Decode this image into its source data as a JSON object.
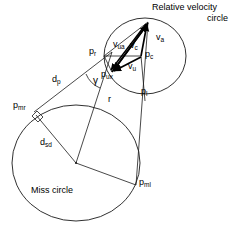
{
  "figure": {
    "name": "relative-velocity-and-miss-circle-geometry-diagram",
    "stroke_color": "#1a1a1a",
    "bold_stroke_color": "#000000",
    "background_color": "#ffffff"
  },
  "captions": {
    "relative_velocity_circle_line1": "Relative velocity",
    "relative_velocity_circle_line2": "circle",
    "miss_circle": "Miss circle"
  },
  "labels": {
    "v_a": {
      "base": "v",
      "sub": "a"
    },
    "v_c": {
      "base": "v",
      "sub": "c"
    },
    "v_u": {
      "base": "v",
      "sub": "u"
    },
    "v_ua": {
      "base": "v",
      "sub": "ua"
    },
    "p_r": {
      "base": "p",
      "sub": "r"
    },
    "p_c": {
      "base": "p",
      "sub": "c"
    },
    "p_l": {
      "base": "p",
      "sub": "l"
    },
    "p_ux": {
      "base": "p",
      "sub": "ux"
    },
    "p_mr": {
      "base": "p",
      "sub": "mr"
    },
    "p_ml": {
      "base": "p",
      "sub": "ml"
    },
    "d_p": {
      "base": "d",
      "sub": "p"
    },
    "d_sd": {
      "base": "d",
      "sub": "sd"
    },
    "r": {
      "base": "r",
      "sub": ""
    },
    "gamma": {
      "base": "γ",
      "sub": ""
    }
  },
  "geometry": {
    "relative_velocity_circle": {
      "cx": 145,
      "cy": 56,
      "rx": 41,
      "ry": 38
    },
    "miss_circle": {
      "cx": 76,
      "cy": 163,
      "rx": 64,
      "ry": 58
    },
    "points": {
      "apex": {
        "x": 148,
        "y": 22
      },
      "p_c": {
        "x": 141,
        "y": 56
      },
      "p_r": {
        "x": 104,
        "y": 56
      },
      "p_ux": {
        "x": 110,
        "y": 71
      },
      "p_l": {
        "x": 143,
        "y": 88
      },
      "p_mr": {
        "x": 34,
        "y": 112
      },
      "p_ml": {
        "x": 136,
        "y": 185
      },
      "miss_center": {
        "x": 76,
        "y": 163
      }
    }
  }
}
